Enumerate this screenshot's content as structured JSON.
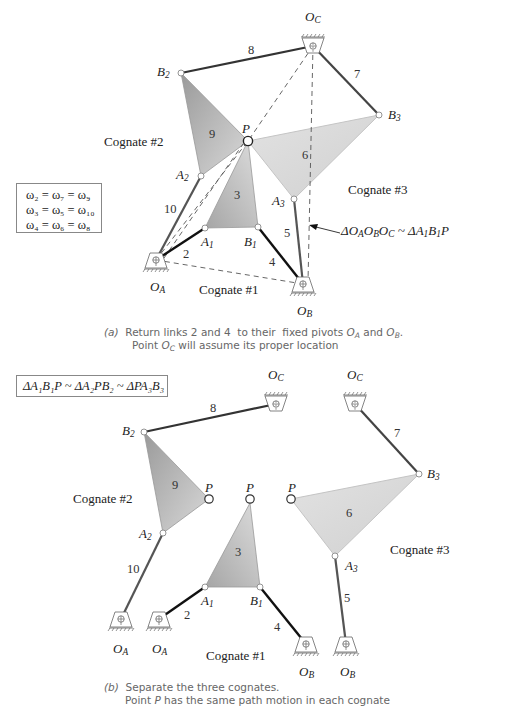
{
  "figure_a": {
    "labels": {
      "OC": "O",
      "OC_sub": "C",
      "B2": "B",
      "B2_sub": "2",
      "B3": "B",
      "B3_sub": "3",
      "P": "P",
      "A2": "A",
      "A2_sub": "2",
      "A3": "A",
      "A3_sub": "3",
      "A1": "A",
      "A1_sub": "1",
      "B1": "B",
      "B1_sub": "1",
      "OA": "O",
      "OA_sub": "A",
      "OB": "O",
      "OB_sub": "B"
    },
    "link_numbers": {
      "l2": "2",
      "l3": "3",
      "l4": "4",
      "l5": "5",
      "l6": "6",
      "l7": "7",
      "l8": "8",
      "l9": "9",
      "l10": "10"
    },
    "cognates": {
      "c1": "Cognate #1",
      "c2": "Cognate #2",
      "c3": "Cognate #3"
    },
    "omega_box": {
      "line1": "ω₂ = ω₇ = ω₉",
      "line2": "ω₃ = ω₅ = ω₁₀",
      "line3": "ω₄ = ω₆ = ω₈"
    },
    "similarity_note": "ΔO_AO_BO_C ~ ΔA_1B_1P",
    "caption": {
      "prefix": "(a)",
      "line1": "Return links 2 and 4  to their  fixed pivots O_A and O_B.",
      "line2": "Point O_C will assume its proper location"
    }
  },
  "figure_b": {
    "similarity_box": "ΔA₁B₁P ~ ΔA₂PB₂ ~ ΔPA₃B₃",
    "labels": {
      "OC": "O",
      "OC_sub": "C",
      "B2": "B",
      "B2_sub": "2",
      "B3": "B",
      "B3_sub": "3",
      "P": "P",
      "A2": "A",
      "A2_sub": "2",
      "A3": "A",
      "A3_sub": "3",
      "A1": "A",
      "A1_sub": "1",
      "B1": "B",
      "B1_sub": "1",
      "OA": "O",
      "OA_sub": "A",
      "OB": "O",
      "OB_sub": "B"
    },
    "link_numbers": {
      "l2": "2",
      "l3": "3",
      "l4": "4",
      "l5": "5",
      "l6": "6",
      "l7": "7",
      "l8": "8",
      "l9": "9",
      "l10": "10"
    },
    "cognates": {
      "c1": "Cognate #1",
      "c2": "Cognate #2",
      "c3": "Cognate #3"
    },
    "caption": {
      "prefix": "(b)",
      "line1": "Separate the three cognates.",
      "line2": "Point P has the same path motion in each cognate"
    }
  },
  "colors": {
    "link_dark": "#111111",
    "link_gray": "#555555",
    "coupler_dark": "#a8a8a8",
    "coupler_light": "#d8d8d8",
    "dashed": "#555555",
    "caption_text": "#666666"
  }
}
